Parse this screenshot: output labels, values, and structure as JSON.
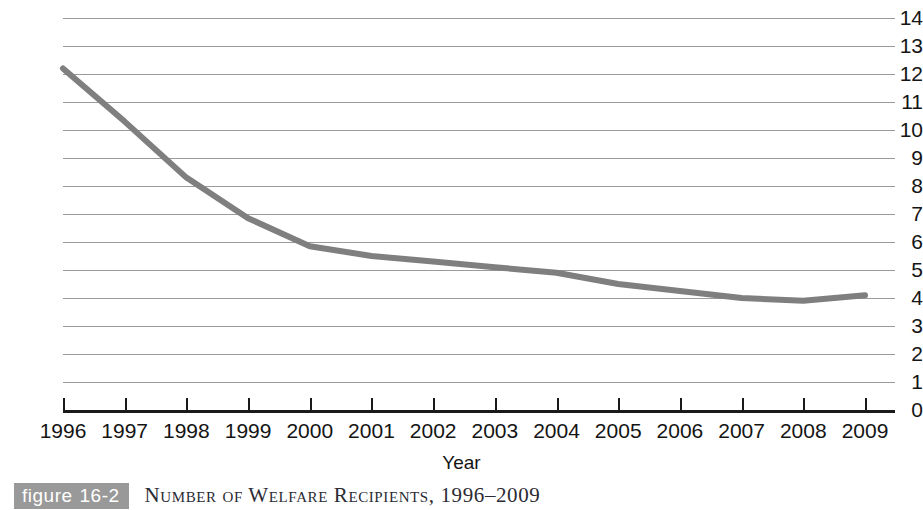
{
  "chart_data": {
    "type": "line",
    "title": "Number of Welfare Recipients, 1996–2009",
    "xlabel": "Year",
    "ylabel": "",
    "categories": [
      "1996",
      "1997",
      "1998",
      "1999",
      "2000",
      "2001",
      "2002",
      "2003",
      "2004",
      "2005",
      "2006",
      "2007",
      "2008",
      "2009"
    ],
    "values": [
      12.2,
      10.3,
      8.3,
      6.85,
      5.85,
      5.5,
      5.3,
      5.1,
      4.9,
      4.5,
      4.25,
      4.0,
      3.9,
      4.1
    ],
    "series": [
      {
        "name": "Welfare recipients (millions)",
        "values": [
          12.2,
          10.3,
          8.3,
          6.85,
          5.85,
          5.5,
          5.3,
          5.1,
          4.9,
          4.5,
          4.25,
          4.0,
          3.9,
          4.1
        ]
      }
    ],
    "ylim": [
      0,
      14
    ],
    "ytick_labels": [
      "14",
      "13",
      "12",
      "11",
      "10",
      "9",
      "8",
      "7",
      "6",
      "5",
      "4",
      "3",
      "2",
      "1",
      "0"
    ],
    "ytick_values": [
      14,
      13,
      12,
      11,
      10,
      9,
      8,
      7,
      6,
      5,
      4,
      3,
      2,
      1,
      0
    ],
    "grid": true,
    "legend": "none",
    "line_color": "#7f7f7f",
    "gridline_color": "#9a9a9a",
    "axis_color": "#1a1a1a"
  },
  "caption": {
    "badge_word": "figure",
    "badge_number": "16-2",
    "title": "Number of Welfare Recipients, 1996–2009",
    "badge_color": "#999999"
  }
}
